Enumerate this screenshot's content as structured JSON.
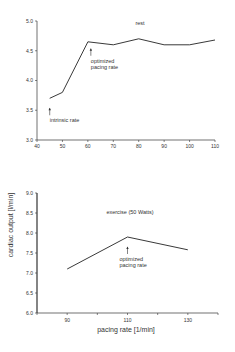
{
  "figure": {
    "ylabel": "cardiac output [l/min]",
    "xlabel": "pacing rate [1/min]"
  },
  "chart_data": [
    {
      "type": "line",
      "title": "rest",
      "xlabel": "",
      "ylabel": "cardiac output [l/min]",
      "x_ticks": [
        "40",
        "50",
        "60",
        "70",
        "80",
        "90",
        "100",
        "110"
      ],
      "y_ticks": [
        "3.0",
        "3.5",
        "4.0",
        "4.5",
        "5.0"
      ],
      "xlim": [
        40,
        110
      ],
      "ylim": [
        3.0,
        5.0
      ],
      "series": [
        {
          "name": "rest",
          "x": [
            45,
            50,
            60,
            70,
            80,
            90,
            100,
            110
          ],
          "values": [
            3.7,
            3.8,
            4.65,
            4.6,
            4.7,
            4.6,
            4.6,
            4.68
          ]
        }
      ],
      "annotations": [
        {
          "text": "intrinsic rate",
          "x": 45,
          "y": 3.5
        },
        {
          "text_lines": [
            "optimized",
            "pacing rate"
          ],
          "x": 60,
          "y": 4.5
        }
      ],
      "grid": false
    },
    {
      "type": "line",
      "title": "exercise (50 Watts)",
      "xlabel": "pacing rate [1/min]",
      "ylabel": "cardiac output [l/min]",
      "x_ticks": [
        "90",
        "110",
        "130"
      ],
      "y_ticks": [
        "6.0",
        "6.5",
        "7.0",
        "7.5",
        "8.0",
        "8.5",
        "9.0"
      ],
      "xlim": [
        80,
        140
      ],
      "ylim": [
        6.0,
        9.0
      ],
      "series": [
        {
          "name": "exercise",
          "x": [
            90,
            110,
            130
          ],
          "values": [
            7.1,
            7.9,
            7.58
          ]
        }
      ],
      "annotations": [
        {
          "text_lines": [
            "optimized",
            "pacing rate"
          ],
          "x": 110,
          "y": 7.6
        }
      ],
      "grid": false
    }
  ]
}
